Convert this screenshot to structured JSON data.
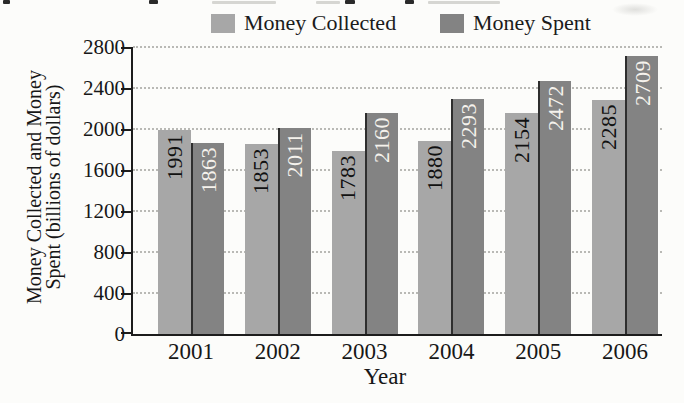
{
  "legend": {
    "items": [
      {
        "label": "Money Collected"
      },
      {
        "label": "Money Spent"
      }
    ]
  },
  "chart_data": {
    "type": "bar",
    "categories": [
      "2001",
      "2002",
      "2003",
      "2004",
      "2005",
      "2006"
    ],
    "series": [
      {
        "name": "Money Collected",
        "color": "#a7a7a7",
        "label_color": "#111111",
        "values": [
          1991,
          1853,
          1783,
          1880,
          2154,
          2285
        ]
      },
      {
        "name": "Money Spent",
        "color": "#838383",
        "label_color": "#f5f2ec",
        "values": [
          1863,
          2011,
          2160,
          2293,
          2472,
          2709
        ]
      }
    ],
    "xlabel": "Year",
    "ylabel": "Money Collected and Money Spent (billions of dollars)",
    "ylabel_lines": [
      "Money Collected and Money",
      "Spent (billions of dollars)"
    ],
    "ylim": [
      0,
      2800
    ],
    "yticks": [
      0,
      400,
      800,
      1200,
      1600,
      2000,
      2400,
      2800
    ],
    "grid": "horizontal-dotted",
    "grid_color": "#b9b9b5",
    "axis_color": "#1c1c1c",
    "background": "#fcfcfa",
    "value_labels_rotated": true,
    "legend_position": "top"
  }
}
